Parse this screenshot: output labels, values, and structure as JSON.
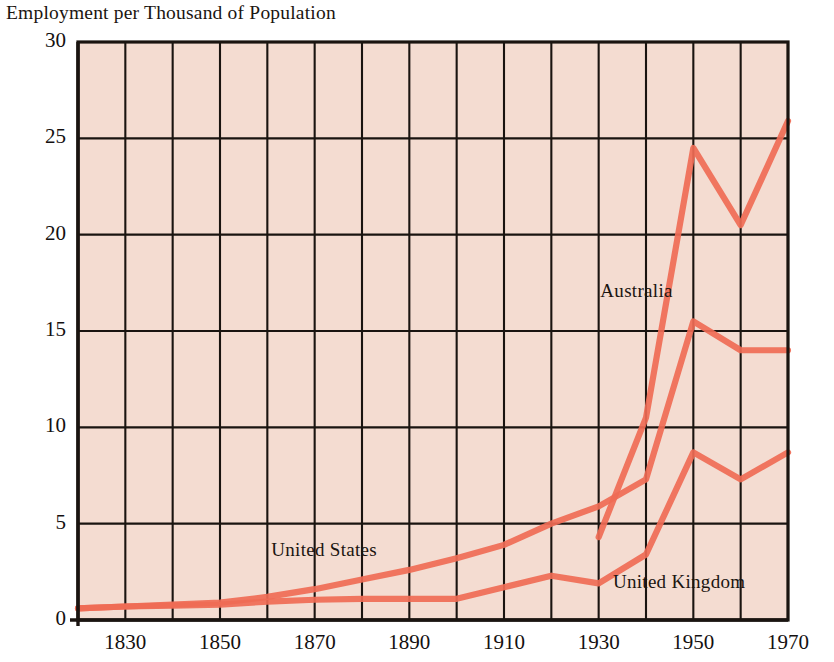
{
  "chart_data": {
    "type": "line",
    "title": "Employment per Thousand of Population",
    "xlabel": "",
    "ylabel": "",
    "xlim": [
      1820,
      1970
    ],
    "ylim": [
      0,
      30
    ],
    "yticks": [
      0,
      5,
      10,
      15,
      20,
      25,
      30
    ],
    "ytick_labels": [
      "0",
      "5",
      "10",
      "15",
      "20",
      "25",
      "30"
    ],
    "xticks": [
      1830,
      1850,
      1870,
      1890,
      1910,
      1930,
      1950,
      1970
    ],
    "xtick_labels": [
      "1830",
      "1850",
      "1870",
      "1890",
      "1910",
      "1930",
      "1950",
      "1970"
    ],
    "gridlines_x": [
      1820,
      1830,
      1840,
      1850,
      1860,
      1870,
      1880,
      1890,
      1900,
      1910,
      1920,
      1930,
      1940,
      1950,
      1960,
      1970
    ],
    "gridlines_y": [
      0,
      5,
      10,
      15,
      20,
      25,
      30
    ],
    "grid": true,
    "legend_position": "inline-annotations",
    "plot_background": "#f4dcd1",
    "line_color": "#ef6b55",
    "axis_color": "#1a1410",
    "series": [
      {
        "name": "United States",
        "label": "United States",
        "x": [
          1820,
          1830,
          1840,
          1850,
          1860,
          1870,
          1880,
          1890,
          1900,
          1910,
          1920,
          1930,
          1940,
          1950,
          1960,
          1970
        ],
        "values": [
          0.6,
          0.7,
          0.8,
          0.9,
          1.2,
          1.6,
          2.1,
          2.6,
          3.2,
          3.9,
          5.0,
          5.9,
          7.3,
          15.5,
          14.0,
          14.0
        ]
      },
      {
        "name": "Australia",
        "label": "Australia",
        "x": [
          1930,
          1940,
          1950,
          1960,
          1970
        ],
        "values": [
          4.3,
          10.5,
          24.5,
          20.5,
          25.9
        ]
      },
      {
        "name": "United Kingdom",
        "label": "United Kingdom",
        "x": [
          1820,
          1830,
          1840,
          1850,
          1860,
          1870,
          1880,
          1890,
          1900,
          1910,
          1920,
          1930,
          1940,
          1950,
          1960,
          1970
        ],
        "values": [
          0.6,
          0.7,
          0.75,
          0.8,
          0.95,
          1.05,
          1.1,
          1.1,
          1.1,
          1.7,
          2.3,
          1.9,
          3.4,
          8.7,
          7.3,
          8.7
        ]
      }
    ],
    "annotations": [
      {
        "text": "Australia",
        "x": 1938,
        "y": 17.0
      },
      {
        "text": "United States",
        "x": 1872,
        "y": 3.6
      },
      {
        "text": "United Kingdom",
        "x": 1947,
        "y": 1.9
      }
    ]
  }
}
